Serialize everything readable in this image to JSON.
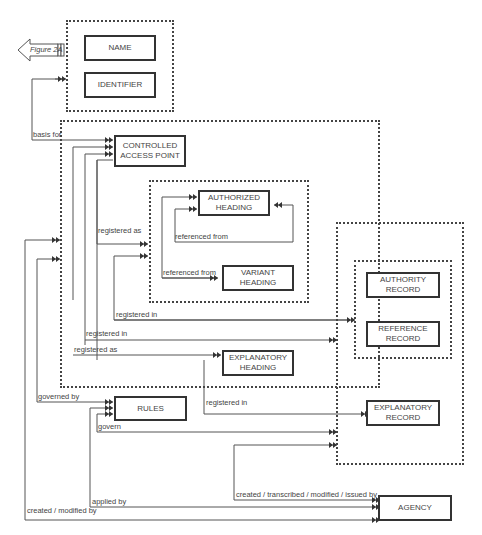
{
  "diagram": {
    "figure_ref": "Figure 2A",
    "entities": {
      "name": "NAME",
      "identifier": "IDENTIFIER",
      "controlled_access_point": "CONTROLLED\nACCESS POINT",
      "authorized_heading": "AUTHORIZED\nHEADING",
      "variant_heading": "VARIANT\nHEADING",
      "explanatory_heading": "EXPLANATORY\nHEADING",
      "authority_record": "AUTHORITY\nRECORD",
      "reference_record": "REFERENCE\nRECORD",
      "explanatory_record": "EXPLANATORY\nRECORD",
      "rules": "RULES",
      "agency": "AGENCY"
    },
    "relationships": {
      "basis_for": "basis for",
      "registered_as_1": "registered as",
      "referenced_from_1": "referenced from",
      "referenced_from_2": "referenced from",
      "registered_in_1": "registered in",
      "registered_in_2": "registered in",
      "registered_as_2": "registered as",
      "governed_by": "governed by",
      "registered_in_3": "registered in",
      "govern": "govern",
      "created_transcribed": "created / transcribed / modified / issued by",
      "applied_by": "applied by",
      "created_modified_by": "created / modified by"
    }
  }
}
